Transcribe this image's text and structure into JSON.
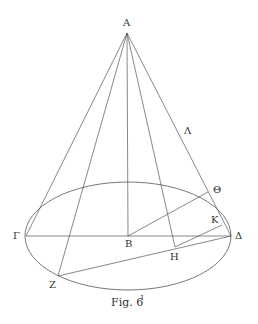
{
  "figure": {
    "caption": "Fig. 6",
    "caption_sup": "1",
    "stroke_color": "#555555",
    "points": {
      "A": {
        "label": "Α",
        "x": 127,
        "y": 33
      },
      "B": {
        "label": "Β",
        "x": 128,
        "y": 236
      },
      "Gamma": {
        "label": "Γ",
        "x": 26,
        "y": 236
      },
      "Delta": {
        "label": "Δ",
        "x": 231,
        "y": 236
      },
      "Z": {
        "label": "Ζ",
        "x": 58,
        "y": 276
      },
      "H": {
        "label": "Η",
        "x": 175,
        "y": 247
      },
      "Theta": {
        "label": "Θ",
        "x": 208,
        "y": 192
      },
      "K": {
        "label": "Κ",
        "x": 222,
        "y": 225
      },
      "Lambda": {
        "label": "Λ",
        "x": 178,
        "y": 131
      }
    },
    "ellipse": {
      "cx": 128,
      "cy": 236,
      "rx": 103,
      "ry": 54
    }
  }
}
